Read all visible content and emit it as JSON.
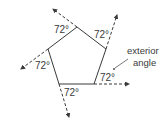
{
  "diagram": {
    "title": "",
    "shape": "regular pentagon",
    "angle_labels": [
      {
        "id": "top",
        "text": "72°"
      },
      {
        "id": "right",
        "text": "72°"
      },
      {
        "id": "bottom-right",
        "text": "72°"
      },
      {
        "id": "bottom-left",
        "text": "72°"
      },
      {
        "id": "left",
        "text": "72°"
      }
    ],
    "annotation": {
      "line1": "exterior",
      "line2": "angle"
    },
    "colors": {
      "stroke": "#3a3a3a",
      "background": "#ffffff"
    }
  }
}
